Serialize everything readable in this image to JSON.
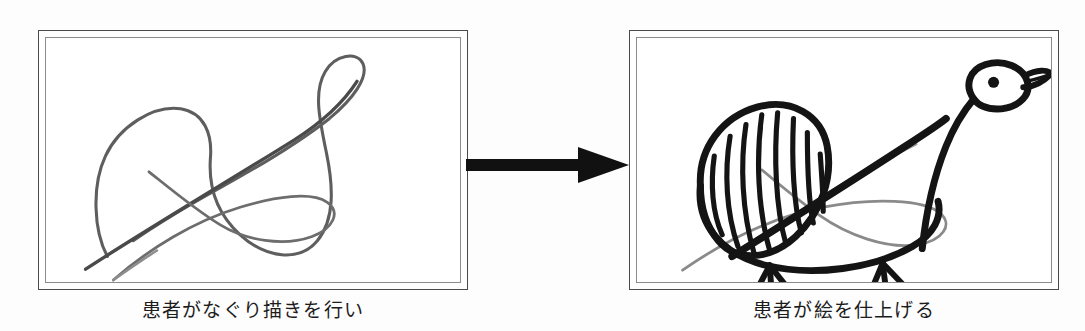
{
  "figure": {
    "kind": "two-panel-process-diagram",
    "background_color": "#fdfdfd",
    "frame_outer_color": "#4a4a4a",
    "frame_inner_color": "#8c8c8c",
    "arrow_color": "#111111",
    "scribble_color": "#5e5e5e",
    "ink_color": "#141414"
  },
  "panels": [
    {
      "id": "left",
      "caption": "患者がなぐり描きを行い",
      "artwork_name": "scribble-drawing",
      "artwork_description": "薄いグレーの一筆書きのなぐり描き（ループを含む曲線）"
    },
    {
      "id": "right",
      "caption": "患者が絵を仕上げる",
      "artwork_name": "completed-bird-drawing",
      "artwork_description": "同じなぐり描きの上から黒いペンで鳥（アヒル）を描き上げた絵。斜線で塗られた翼、目、くちばし、二本の脚。"
    }
  ],
  "arrow": {
    "name": "process-arrow",
    "direction": "right",
    "label": ""
  }
}
